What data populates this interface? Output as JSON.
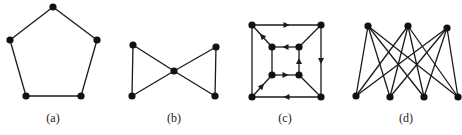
{
  "figure": {
    "panels": [
      {
        "id": "a",
        "label": "(a)",
        "label_pos": [
          53,
          122
        ],
        "nodes": [
          [
            53,
            7
          ],
          [
            97,
            40
          ],
          [
            81,
            96
          ],
          [
            26,
            96
          ],
          [
            10,
            40
          ]
        ],
        "edges": [
          [
            0,
            1
          ],
          [
            1,
            2
          ],
          [
            2,
            3
          ],
          [
            3,
            4
          ],
          [
            4,
            0
          ]
        ],
        "directed": false
      },
      {
        "id": "b",
        "label": "(b)",
        "label_pos": [
          174,
          122
        ],
        "nodes": [
          [
            133,
            45
          ],
          [
            132,
            96
          ],
          [
            174,
            71
          ],
          [
            216,
            47
          ],
          [
            215,
            96
          ]
        ],
        "edges": [
          [
            0,
            1
          ],
          [
            0,
            2
          ],
          [
            1,
            2
          ],
          [
            2,
            3
          ],
          [
            2,
            4
          ],
          [
            3,
            4
          ]
        ],
        "directed": false
      },
      {
        "id": "c",
        "label": "(c)",
        "label_pos": [
          285,
          122
        ],
        "nodes": [
          [
            252,
            25
          ],
          [
            321,
            25
          ],
          [
            321,
            97
          ],
          [
            252,
            97
          ],
          [
            272,
            47
          ],
          [
            299,
            47
          ],
          [
            299,
            75
          ],
          [
            272,
            75
          ]
        ],
        "edges": [
          [
            0,
            1
          ],
          [
            1,
            2
          ],
          [
            2,
            3
          ],
          [
            3,
            7
          ],
          [
            7,
            6
          ],
          [
            6,
            5
          ],
          [
            5,
            4
          ],
          [
            4,
            0
          ],
          [
            0,
            3
          ],
          [
            1,
            5
          ],
          [
            2,
            6
          ],
          [
            4,
            7
          ]
        ],
        "arcs": [
          [
            0,
            1
          ],
          [
            1,
            2
          ],
          [
            2,
            3
          ],
          [
            3,
            7
          ],
          [
            7,
            6
          ],
          [
            6,
            5
          ],
          [
            5,
            4
          ],
          [
            4,
            0
          ]
        ],
        "directed": true
      },
      {
        "id": "d",
        "label": "(d)",
        "label_pos": [
          406,
          122
        ],
        "nodes": [
          [
            368,
            26
          ],
          [
            408,
            26
          ],
          [
            447,
            28
          ],
          [
            356,
            96
          ],
          [
            390,
            97
          ],
          [
            424,
            97
          ],
          [
            458,
            97
          ]
        ],
        "edges": [
          [
            0,
            3
          ],
          [
            0,
            4
          ],
          [
            0,
            5
          ],
          [
            0,
            6
          ],
          [
            1,
            3
          ],
          [
            1,
            4
          ],
          [
            1,
            5
          ],
          [
            1,
            6
          ],
          [
            2,
            3
          ],
          [
            2,
            4
          ],
          [
            2,
            5
          ],
          [
            2,
            6
          ]
        ],
        "directed": false
      }
    ],
    "colors": {
      "edge": "#1a1a1a",
      "node": "#111111",
      "background": "#ffffff"
    }
  }
}
